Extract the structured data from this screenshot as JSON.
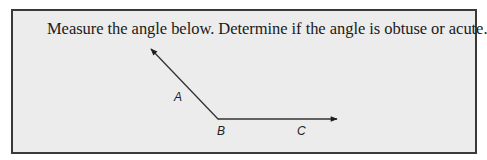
{
  "problem": {
    "instruction": "Measure the angle below. Determine if the angle is obtuse or acute."
  },
  "figure": {
    "type": "angle",
    "vertex_label": "B",
    "ray_labels": [
      "A",
      "C"
    ],
    "labels": {
      "A": "A",
      "B": "B",
      "C": "C"
    },
    "stroke_color": "#222222"
  },
  "colors": {
    "box_background": "#ececec",
    "box_border": "#3a3a3a",
    "text": "#1a1a1a"
  }
}
